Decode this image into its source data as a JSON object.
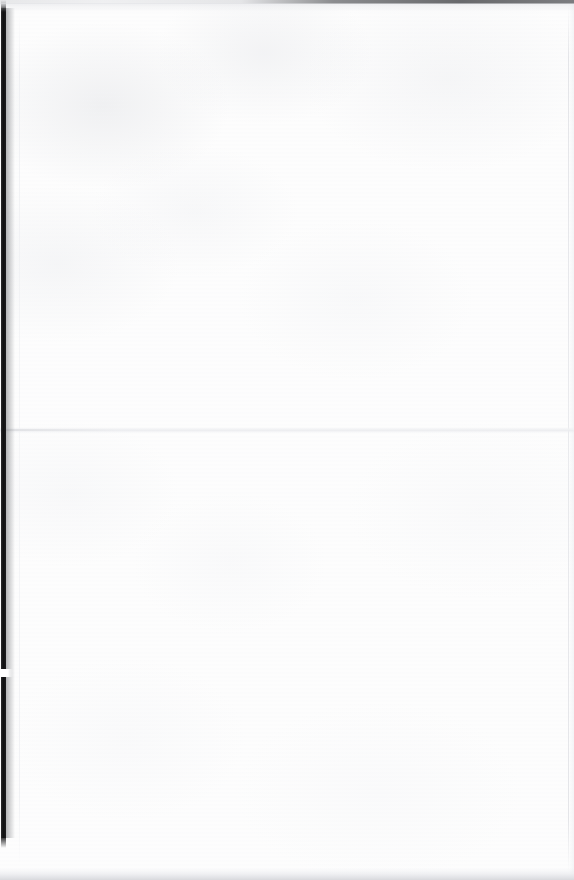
{
  "document": {
    "kind": "scanned-page",
    "page_state": "blank",
    "visible_text": "",
    "width_px": 574,
    "height_px": 880
  },
  "page": {
    "background_color": "#fdfdfd",
    "texture": "mottled scan grain, very low contrast",
    "content_text": ""
  },
  "artifacts": {
    "binding_gutter": {
      "name": "binding-gutter-strip",
      "color": "#101011",
      "edge": "left",
      "x_px": 1,
      "width_px": 5,
      "top_px": 8,
      "height_px": 830
    },
    "gutter_notch": {
      "name": "gutter-notch",
      "color": "#ffffff",
      "x_px": 0,
      "y_px": 669,
      "width_px": 13,
      "height_px": 8
    },
    "fold_crease": {
      "name": "horizontal-fold-crease",
      "color": "#ecedf0",
      "y_px": 429,
      "orientation": "horizontal",
      "spans_full_width": true
    },
    "top_edge_shadow": {
      "name": "top-edge-shadow",
      "color": "#60616430",
      "height_px": 4
    },
    "bottom_edge_shadow": {
      "name": "bottom-edge-shadow",
      "color": "#d6d7db",
      "height_px": 12
    },
    "right_edge_line": {
      "name": "right-edge-line",
      "color": "#e0e1e5",
      "x_px": 568
    }
  }
}
